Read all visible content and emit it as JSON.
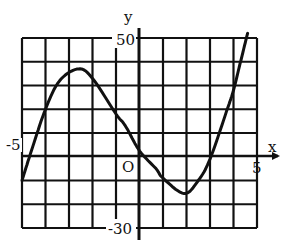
{
  "chart_data": {
    "type": "line",
    "title": "",
    "xlabel": "x",
    "ylabel": "y",
    "xlim": [
      -5,
      5
    ],
    "ylim": [
      -30,
      50
    ],
    "grid": true,
    "x_grid_step": 1,
    "y_grid_step": 10,
    "tick_labels": {
      "x_min": "-5",
      "x_max": "5",
      "y_max": "50",
      "y_min": "-30",
      "origin": "O"
    },
    "series": [
      {
        "name": "f(x)",
        "x": [
          -5.0,
          -4.6,
          -4.0,
          -3.4,
          -2.6,
          -2.0,
          -1.0,
          -0.6,
          0.0,
          0.7,
          1.0,
          1.9,
          2.5,
          3.0,
          3.7,
          4.0,
          4.3,
          4.6
        ],
        "y": [
          -10,
          2.5,
          20,
          32,
          37,
          33,
          18,
          13,
          2.5,
          -5,
          -9,
          -15.5,
          -10,
          -1,
          19,
          28,
          40,
          52
        ]
      }
    ],
    "extrema": {
      "local_max": {
        "x": -2.6,
        "y": 37
      },
      "local_min": {
        "x": 1.9,
        "y": -15.5
      }
    }
  },
  "labels": {
    "x_axis": "x",
    "y_axis": "y",
    "origin": "O",
    "x_min": "-5",
    "x_max": "5",
    "y_max": "50",
    "y_min": "-30"
  }
}
